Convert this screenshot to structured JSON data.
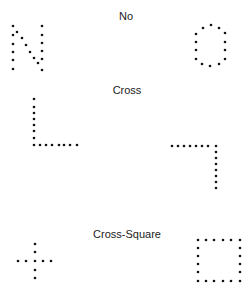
{
  "labels": {
    "no": "No",
    "cross": "Cross",
    "cross_square": "Cross-Square"
  },
  "dot_color": "#111111",
  "shapes": {
    "n_letter": [
      [
        13,
        26
      ],
      [
        13,
        35
      ],
      [
        13,
        44
      ],
      [
        13,
        52
      ],
      [
        13,
        60
      ],
      [
        13,
        69
      ],
      [
        17,
        32
      ],
      [
        22,
        38
      ],
      [
        26,
        45
      ],
      [
        30,
        52
      ],
      [
        34,
        58
      ],
      [
        38,
        63
      ],
      [
        42,
        26
      ],
      [
        42,
        35
      ],
      [
        42,
        43
      ],
      [
        42,
        51
      ],
      [
        42,
        59
      ],
      [
        42,
        70
      ]
    ],
    "o_letter": [
      [
        203,
        28
      ],
      [
        211,
        25
      ],
      [
        219,
        28
      ],
      [
        225,
        33
      ],
      [
        225,
        42
      ],
      [
        225,
        50
      ],
      [
        225,
        59
      ],
      [
        219,
        64
      ],
      [
        210,
        66
      ],
      [
        202,
        64
      ],
      [
        196,
        59
      ],
      [
        196,
        50
      ],
      [
        196,
        42
      ],
      [
        196,
        34
      ]
    ],
    "l_shape": [
      [
        34,
        99
      ],
      [
        34,
        107
      ],
      [
        34,
        113
      ],
      [
        34,
        119
      ],
      [
        34,
        125
      ],
      [
        34,
        131
      ],
      [
        34,
        138
      ],
      [
        34,
        145
      ],
      [
        40,
        145
      ],
      [
        46,
        145
      ],
      [
        52,
        145
      ],
      [
        59,
        145
      ],
      [
        64,
        145
      ],
      [
        70,
        145
      ],
      [
        77,
        145
      ]
    ],
    "reverse_l_shape": [
      [
        172,
        146
      ],
      [
        178,
        146
      ],
      [
        184,
        146
      ],
      [
        190,
        146
      ],
      [
        196,
        146
      ],
      [
        202,
        146
      ],
      [
        208,
        146
      ],
      [
        216,
        146
      ],
      [
        216,
        152
      ],
      [
        216,
        158
      ],
      [
        216,
        164
      ],
      [
        216,
        170
      ],
      [
        216,
        176
      ],
      [
        216,
        182
      ],
      [
        216,
        188
      ]
    ],
    "plus_shape": [
      [
        35,
        244
      ],
      [
        35,
        252
      ],
      [
        18,
        261
      ],
      [
        26,
        261
      ],
      [
        35,
        261
      ],
      [
        43,
        261
      ],
      [
        51,
        261
      ],
      [
        35,
        270
      ],
      [
        35,
        278
      ]
    ],
    "square_shape": [
      [
        198,
        240
      ],
      [
        206,
        240
      ],
      [
        214,
        240
      ],
      [
        223,
        240
      ],
      [
        231,
        240
      ],
      [
        240,
        240
      ],
      [
        198,
        248
      ],
      [
        240,
        248
      ],
      [
        198,
        256
      ],
      [
        240,
        256
      ],
      [
        198,
        264
      ],
      [
        240,
        264
      ],
      [
        198,
        272
      ],
      [
        240,
        272
      ],
      [
        198,
        281
      ],
      [
        206,
        281
      ],
      [
        214,
        281
      ],
      [
        223,
        281
      ],
      [
        231,
        281
      ],
      [
        240,
        281
      ]
    ]
  }
}
